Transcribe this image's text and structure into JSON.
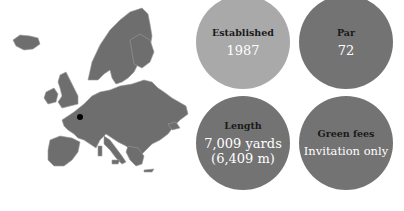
{
  "map": {
    "region": "Europe",
    "marker": "France (Loire region)",
    "map_color": "#6e6e6e",
    "marker_color": "#000000"
  },
  "stats": [
    {
      "label": "Established",
      "value": "1987",
      "color": "#a9a9a9"
    },
    {
      "label": "Par",
      "value": "72",
      "color": "#737373"
    },
    {
      "label": "Length",
      "value_line1": "7,009 yards",
      "value_line2": "(6,409 m)",
      "color": "#737373"
    },
    {
      "label": "Green fees",
      "value": "Invitation only",
      "color": "#737373"
    }
  ]
}
